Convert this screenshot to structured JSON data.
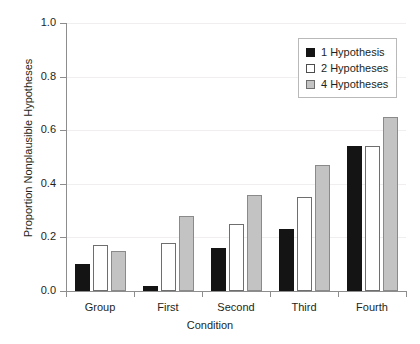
{
  "chart_data": {
    "type": "bar",
    "title": "",
    "xlabel": "Condition",
    "ylabel": "Proportion Nonplausible Hypotheses",
    "categories": [
      "Group",
      "First",
      "Second",
      "Third",
      "Fourth"
    ],
    "series": [
      {
        "name": "1 Hypothesis",
        "color": "#141414",
        "values": [
          0.1,
          0.02,
          0.16,
          0.23,
          0.54
        ]
      },
      {
        "name": "2 Hypotheses",
        "color": "#ffffff",
        "values": [
          0.17,
          0.18,
          0.25,
          0.35,
          0.54
        ]
      },
      {
        "name": "4 Hypotheses",
        "color": "#c3c3c3",
        "values": [
          0.15,
          0.28,
          0.36,
          0.47,
          0.65
        ]
      }
    ],
    "ylim": [
      0.0,
      1.0
    ],
    "yticks": [
      0.0,
      0.2,
      0.4,
      0.6,
      0.8,
      1.0
    ],
    "ytick_labels": [
      "0.0",
      "0.2",
      "0.4",
      "0.6",
      "0.8",
      "1.0"
    ],
    "grid": true,
    "grid_axis": "y",
    "legend_position": "top-right",
    "legend_entries": [
      "1 Hypothesis",
      "2 Hypotheses",
      "4 Hypotheses"
    ]
  }
}
